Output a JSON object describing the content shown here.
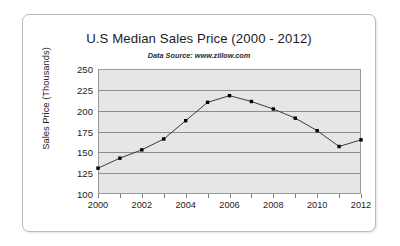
{
  "chart_data": {
    "type": "line",
    "title": "U.S Median Sales Price (2000 - 2012)",
    "subtitle": "Data Source: www.zillow.com",
    "xlabel": "",
    "ylabel": "Sales Price (Thousands)",
    "x": [
      2000,
      2001,
      2002,
      2003,
      2004,
      2005,
      2006,
      2007,
      2008,
      2009,
      2010,
      2011,
      2012
    ],
    "values": [
      131,
      143,
      153,
      166,
      188,
      210,
      218,
      211,
      202,
      191,
      176,
      157,
      165
    ],
    "series": [
      {
        "name": "U.S Median Sales Price",
        "values": [
          131,
          143,
          153,
          166,
          188,
          210,
          218,
          211,
          202,
          191,
          176,
          157,
          165
        ]
      }
    ],
    "xlim": [
      2000,
      2012
    ],
    "ylim": [
      100,
      250
    ],
    "ytick_labels": [
      "250",
      "225",
      "200",
      "175",
      "150",
      "125",
      "100"
    ],
    "yticks": [
      250,
      225,
      200,
      175,
      150,
      125,
      100
    ],
    "xtick_labels": [
      "2000",
      "2002",
      "2004",
      "2006",
      "2008",
      "2010",
      "2012"
    ],
    "xticks": [
      2000,
      2002,
      2004,
      2006,
      2008,
      2010,
      2012
    ],
    "xtick_minor": [
      2000,
      2001,
      2002,
      2003,
      2004,
      2005,
      2006,
      2007,
      2008,
      2009,
      2010,
      2011,
      2012
    ],
    "grid": true,
    "grid_axis": "y",
    "legend": false,
    "legend_position": "none",
    "marker": "square",
    "line_color": "#3a3a3a",
    "marker_color": "#000000",
    "plot_background": "#e6e6e6",
    "grid_color": "#8c8c8c",
    "card_border_color": "#b9b9b9",
    "text_color": "#1c1c1c"
  }
}
